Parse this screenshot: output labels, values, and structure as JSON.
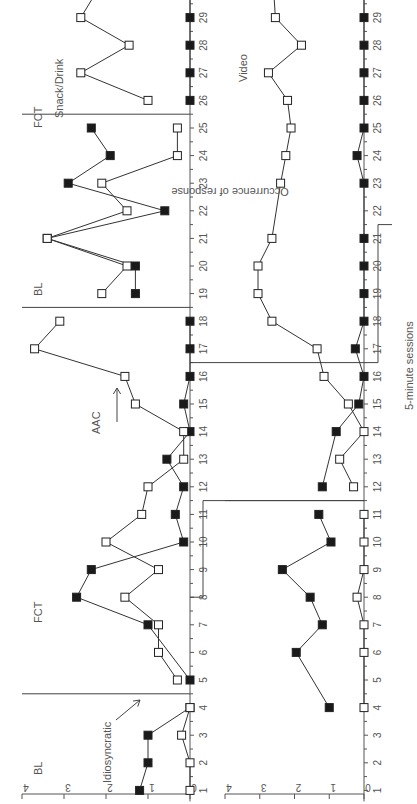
{
  "chart_data": [
    {
      "type": "line",
      "panel": "top",
      "title": "",
      "xlabel": "5-minute sessions",
      "ylabel": "Occurrence of response",
      "ylim": [
        0,
        4
      ],
      "yticks": [
        0,
        1,
        2,
        3,
        4
      ],
      "xticks": [
        1,
        2,
        3,
        4,
        5,
        6,
        7,
        8,
        9,
        10,
        11,
        12,
        13,
        14,
        15,
        16,
        17,
        18,
        19,
        20,
        21,
        22,
        23,
        24,
        25,
        26,
        27,
        28,
        29,
        30
      ],
      "phases": [
        {
          "label": "BL",
          "start": 1,
          "end": 4
        },
        {
          "label": "FCT",
          "start": 5,
          "end": 18
        },
        {
          "label": "BL",
          "start": 19,
          "end": 25
        },
        {
          "label": "FCT",
          "start": 26,
          "end": 30
        }
      ],
      "phase_change_after": [
        4.5,
        18.5,
        25.5
      ],
      "annotations": [
        {
          "text": "Idiosyncratic",
          "arrow_to_session": 2
        },
        {
          "text": "AAC",
          "arrow_to_session": 16
        },
        {
          "text": "Snack/Drink",
          "session": 27
        }
      ],
      "series": [
        {
          "name": "Idiosyncratic",
          "marker": "filled-square",
          "x": [
            1,
            2,
            3,
            4,
            5,
            7,
            8,
            9,
            10,
            11,
            12,
            13,
            14,
            15,
            16,
            17,
            18,
            19,
            20,
            21,
            22,
            23,
            24,
            25,
            26,
            27,
            28,
            29,
            30
          ],
          "values": [
            1.2,
            1.0,
            1.0,
            0,
            0,
            1.0,
            2.7,
            2.35,
            0.15,
            0.35,
            0.15,
            0.55,
            0,
            0.15,
            0,
            0,
            0,
            1.3,
            1.3,
            3.4,
            0.6,
            2.9,
            1.9,
            2.35,
            0,
            0,
            0,
            0,
            0
          ]
        },
        {
          "name": "AAC / Snack/Drink",
          "marker": "open-square",
          "x": [
            1,
            2,
            3,
            4,
            5,
            6,
            7,
            8,
            9,
            10,
            11,
            12,
            13,
            14,
            15,
            16,
            17,
            18,
            19,
            20,
            21,
            22,
            23,
            24,
            25,
            26,
            27,
            28,
            29,
            30
          ],
          "values": [
            0,
            0,
            0.2,
            0,
            0.3,
            0.75,
            0.75,
            1.55,
            0.75,
            2.0,
            1.15,
            1.0,
            0.15,
            0.15,
            1.3,
            1.55,
            3.7,
            3.1,
            2.1,
            1.5,
            3.4,
            1.5,
            2.1,
            0.3,
            0.3,
            1.0,
            2.6,
            1.45,
            2.6,
            2.2
          ]
        }
      ]
    },
    {
      "type": "line",
      "panel": "bottom",
      "title": "",
      "xlabel": "5-minute sessions",
      "ylabel": "Occurrence of response",
      "ylim": [
        0,
        4
      ],
      "yticks": [
        0,
        1,
        2,
        3,
        4
      ],
      "xticks": [
        1,
        2,
        3,
        4,
        5,
        6,
        7,
        8,
        9,
        10,
        11,
        12,
        13,
        14,
        15,
        16,
        17,
        18,
        19,
        20,
        21,
        22,
        23,
        24,
        25,
        26,
        27,
        28,
        29,
        30
      ],
      "phase_change_after": [
        11.5
      ],
      "annotations": [
        {
          "text": "Video",
          "session": 29
        }
      ],
      "series": [
        {
          "name": "Idiosyncratic",
          "marker": "filled-square",
          "x": [
            4,
            6,
            7,
            8,
            9,
            10,
            11,
            12,
            14,
            15,
            16,
            17,
            18,
            19,
            20,
            21,
            23,
            24,
            25,
            26,
            27,
            28,
            29,
            30
          ],
          "values": [
            1.0,
            1.95,
            1.2,
            1.55,
            2.35,
            0.95,
            1.3,
            1.2,
            0.8,
            0.15,
            0,
            0.25,
            0,
            0,
            0,
            0,
            0,
            0.2,
            0,
            0,
            0,
            0,
            0,
            0
          ]
        },
        {
          "name": "Video",
          "marker": "open-square",
          "x": [
            4,
            6,
            7,
            8,
            9,
            10,
            11,
            12,
            13,
            14,
            15,
            16,
            17,
            18,
            19,
            20,
            21,
            23,
            24,
            25,
            26,
            27,
            28,
            29,
            30
          ],
          "values": [
            0,
            0,
            0,
            0.2,
            0,
            0,
            0,
            0.3,
            0.7,
            0,
            0.45,
            1.15,
            1.35,
            2.65,
            3.05,
            3.05,
            2.65,
            2.4,
            2.25,
            2.1,
            2.2,
            2.75,
            1.8,
            2.55,
            2.6
          ]
        }
      ]
    }
  ],
  "labels": {
    "ylabel": "Occurrence of response",
    "xlabel": "5-minute sessions",
    "bl1": "BL",
    "fct1": "FCT",
    "bl2": "BL",
    "fct2": "FCT",
    "idiosyncratic": "Idiosyncratic",
    "aac": "AAC",
    "snack": "Snack/Drink",
    "video": "Video"
  }
}
